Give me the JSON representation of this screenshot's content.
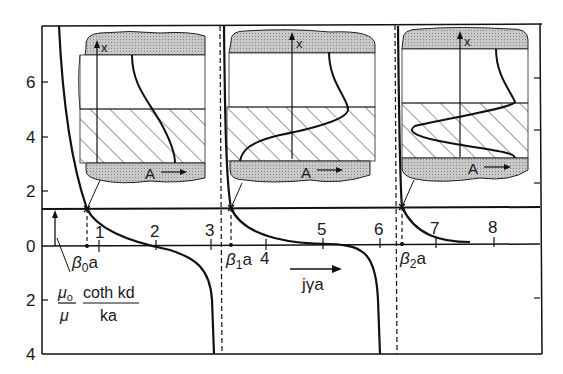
{
  "figure": {
    "y_axis": {
      "upper_ticks": [
        "6",
        "4",
        "2"
      ],
      "zero": "0",
      "lower_ticks": [
        "2",
        "4"
      ]
    },
    "x_axis": {
      "ticks": [
        "1",
        "2",
        "3",
        "4",
        "5",
        "6",
        "7",
        "8"
      ],
      "label": "jγa",
      "arrow": "right-arrow"
    },
    "roots": [
      {
        "label": "β",
        "sub": "0",
        "suffix": "a"
      },
      {
        "label": "β",
        "sub": "1",
        "suffix": "a"
      },
      {
        "label": "β",
        "sub": "2",
        "suffix": "a"
      }
    ],
    "level_label": {
      "frac1_num": "μ",
      "frac1_num_sub": "o",
      "frac1_den": "μ",
      "frac2_num": "coth kd",
      "frac2_den": "ka"
    },
    "insets": [
      {
        "axis_label": "x",
        "field_label": "A",
        "mode": "β0a"
      },
      {
        "axis_label": "x",
        "field_label": "A",
        "mode": "β1a"
      },
      {
        "axis_label": "x",
        "field_label": "A",
        "mode": "β2a"
      }
    ]
  }
}
